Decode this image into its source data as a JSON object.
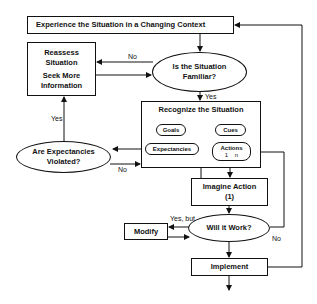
{
  "diagram": {
    "nodes": {
      "experience": "Experience the Situation in a Changing Context",
      "reassess": "Reassess Situation",
      "seek": "Seek More Information",
      "familiar": "Is the Situation Familiar?",
      "recognize_title": "Recognize the Situation",
      "goals": "Goals",
      "cues": "Cues",
      "expectancies": "Expectancies",
      "actions": "Actions",
      "actions_sub": "1    n",
      "violated": "Are Expectancies Violated?",
      "imagine": "Imagine Action",
      "imagine_sub": "(1)",
      "modify": "Modify",
      "will_work": "Will it Work?",
      "implement": "Implement"
    },
    "edge_labels": {
      "no_familiar": "No",
      "yes_familiar": "Yes",
      "yes_violated": "Yes",
      "no_violated": "No",
      "yes_but": "Yes, but",
      "no_work": "No"
    }
  }
}
